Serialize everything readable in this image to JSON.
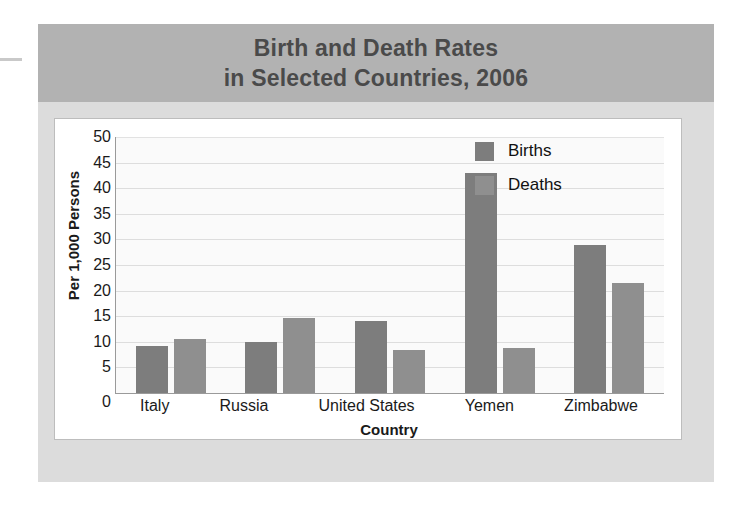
{
  "chart_data": {
    "type": "bar",
    "title": "Birth and Death Rates in Selected Countries, 2006",
    "title_line1": "Birth and Death Rates",
    "title_line2": "in Selected Countries, 2006",
    "xlabel": "Country",
    "ylabel": "Per 1,000 Persons",
    "categories": [
      "Italy",
      "Russia",
      "United States",
      "Yemen",
      "Zimbabwe"
    ],
    "series": [
      {
        "name": "Births",
        "color": "#7d7d7d",
        "values": [
          9.2,
          9.9,
          14.1,
          43.0,
          29.0
        ]
      },
      {
        "name": "Deaths",
        "color": "#8f8f8f",
        "values": [
          10.5,
          14.7,
          8.4,
          8.8,
          21.5
        ]
      }
    ],
    "ylim": [
      0,
      50
    ],
    "ytick_step": 5,
    "yticks": [
      50,
      45,
      40,
      35,
      30,
      25,
      20,
      15,
      10,
      5,
      0
    ],
    "grid": true,
    "grid_axis": "y",
    "legend_position": "top-right",
    "legend_entries": [
      "Births",
      "Deaths"
    ]
  },
  "colors": {
    "banner_background": "#b2b2b2",
    "banner_text": "#4a4a4a",
    "panel_background": "#dcdcdc",
    "card_background": "#ffffff",
    "plot_background": "#fafafa",
    "gridline": "#dddddd",
    "axis": "#9a9a9a",
    "births_bar": "#7d7d7d",
    "deaths_bar": "#8f8f8f"
  }
}
